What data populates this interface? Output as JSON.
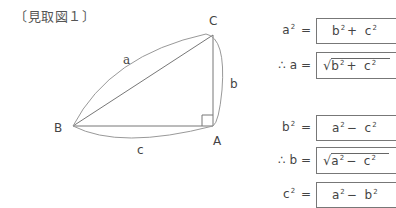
{
  "title": "〔見取図１〕",
  "figure": {
    "vertices": {
      "A": "A",
      "B": "B",
      "C": "C"
    },
    "sides": {
      "a": "a",
      "b": "b",
      "c": "c"
    },
    "right_angle_at": "A",
    "line_color": "#777777"
  },
  "equations": [
    {
      "lhs_prefix": "",
      "lhs_var": "a",
      "lhs_exp": "2",
      "eq": "=",
      "root": false,
      "rhs": [
        {
          "v": "b",
          "e": "2"
        },
        {
          "op": "+"
        },
        {
          "v": "c",
          "e": "2"
        }
      ]
    },
    {
      "lhs_prefix": "∴",
      "lhs_var": "a",
      "lhs_exp": "",
      "eq": "=",
      "root": true,
      "rhs": [
        {
          "v": "b",
          "e": "2"
        },
        {
          "op": "+"
        },
        {
          "v": "c",
          "e": "2"
        }
      ]
    },
    {
      "lhs_prefix": "",
      "lhs_var": "b",
      "lhs_exp": "2",
      "eq": "=",
      "root": false,
      "rhs": [
        {
          "v": "a",
          "e": "2"
        },
        {
          "op": "−"
        },
        {
          "v": "c",
          "e": "2"
        }
      ]
    },
    {
      "lhs_prefix": "∴",
      "lhs_var": "b",
      "lhs_exp": "",
      "eq": "=",
      "root": true,
      "rhs": [
        {
          "v": "a",
          "e": "2"
        },
        {
          "op": "−"
        },
        {
          "v": "c",
          "e": "2"
        }
      ]
    },
    {
      "lhs_prefix": "",
      "lhs_var": "c",
      "lhs_exp": "2",
      "eq": "=",
      "root": false,
      "rhs": [
        {
          "v": "a",
          "e": "2"
        },
        {
          "op": "−"
        },
        {
          "v": "b",
          "e": "2"
        }
      ]
    }
  ]
}
